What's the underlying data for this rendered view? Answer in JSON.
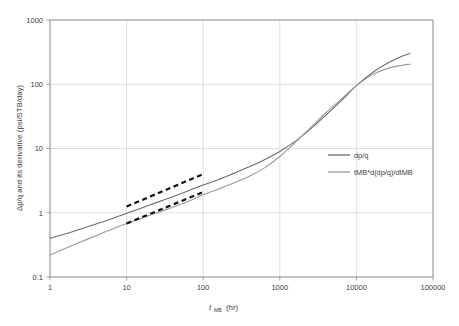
{
  "chart_data": {
    "type": "line",
    "title": "",
    "xlabel": "t_MB (hr)",
    "xlabel_base": "t",
    "xlabel_sub": "MB",
    "xlabel_unit": "(hr)",
    "ylabel": "Δp/q and its derivative (psi/STB/day)",
    "xscale": "log",
    "yscale": "log",
    "xlim": [
      1,
      100000
    ],
    "ylim": [
      0.1,
      1000
    ],
    "grid": true,
    "legend_position": "inside-right",
    "xticks": [
      "1",
      "10",
      "100",
      "1000",
      "10000",
      "100000"
    ],
    "xtick_values": [
      1,
      10,
      100,
      1000,
      10000,
      100000
    ],
    "yticks": [
      "0.1",
      "1",
      "10",
      "100",
      "1000"
    ],
    "ytick_values": [
      0.1,
      1,
      10,
      100,
      1000
    ],
    "series": [
      {
        "name": "dp/q",
        "color": "#6b6b6b",
        "style": "solid",
        "x": [
          1,
          1.6,
          2.5,
          4,
          6.3,
          10,
          16,
          25,
          40,
          63,
          100,
          160,
          250,
          400,
          630,
          1000,
          1600,
          2500,
          4000,
          6300,
          10000,
          16000,
          25000,
          40000,
          50000
        ],
        "y": [
          0.4,
          0.47,
          0.56,
          0.67,
          0.8,
          0.98,
          1.2,
          1.45,
          1.78,
          2.18,
          2.7,
          3.3,
          4.1,
          5.2,
          6.7,
          9.0,
          13.0,
          20.0,
          33.0,
          55.0,
          95.0,
          150.0,
          210.0,
          275.0,
          300.0
        ]
      },
      {
        "name": "tMB*d(dp/q)/dtMB",
        "color": "#9a9a9a",
        "style": "solid",
        "x": [
          1,
          1.6,
          2.5,
          4,
          6.3,
          10,
          16,
          25,
          40,
          63,
          100,
          160,
          250,
          400,
          630,
          1000,
          1600,
          2500,
          4000,
          6300,
          10000,
          16000,
          25000,
          40000,
          50000
        ],
        "y": [
          0.22,
          0.28,
          0.35,
          0.44,
          0.55,
          0.68,
          0.83,
          1.0,
          1.22,
          1.5,
          1.9,
          2.35,
          2.9,
          3.7,
          5.0,
          7.5,
          12.5,
          21.0,
          36.0,
          58.0,
          95.0,
          140.0,
          175.0,
          198.0,
          205.0
        ]
      }
    ],
    "annotations": [
      {
        "name": "unit-slope-line-upper",
        "type": "dashed-line",
        "color": "#111111",
        "x": [
          10,
          100
        ],
        "y": [
          1.25,
          4.0
        ]
      },
      {
        "name": "unit-slope-line-lower",
        "type": "dashed-line",
        "color": "#111111",
        "x": [
          10,
          100
        ],
        "y": [
          0.68,
          2.1
        ]
      }
    ],
    "legend": [
      {
        "label": "dp/q",
        "color": "#6b6b6b"
      },
      {
        "label": "tMB*d(dp/q)/dtMB",
        "color": "#9a9a9a"
      }
    ]
  }
}
